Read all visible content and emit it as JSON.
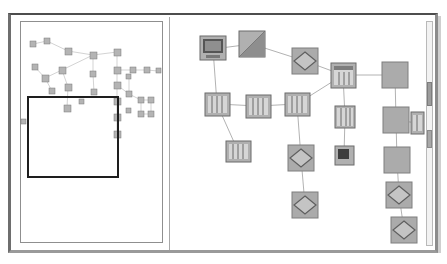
{
  "window": {
    "title": "Network Topology Map",
    "background_color": "#ffffff",
    "frame_color": "#6e6e6e"
  },
  "panels": {
    "overview": {
      "name": "Overview Minimap",
      "border_color": "#8f8f8f",
      "viewport": {
        "label": "viewport-selection",
        "x": 6,
        "y": 74,
        "width": 92,
        "height": 82,
        "color": "#1e1e1e"
      }
    },
    "detail": {
      "name": "Detail Topology View",
      "scrollbar": {
        "orientation": "vertical",
        "track_color": "#f2f2f2",
        "thumb_color": "#9c9c9c"
      }
    }
  },
  "legend": {
    "icon_types": [
      "workstation-icon",
      "router-icon",
      "switch-icon",
      "server-icon",
      "node-icon",
      "device-icon"
    ]
  },
  "chart_data": {
    "type": "network-graph",
    "detail_nodes": [
      {
        "id": "n1",
        "type": "workstation",
        "x": 40,
        "y": 29
      },
      {
        "id": "n2",
        "type": "router",
        "x": 79,
        "y": 24
      },
      {
        "id": "n3",
        "type": "switch",
        "x": 132,
        "y": 41
      },
      {
        "id": "n4",
        "type": "server",
        "x": 44,
        "y": 84
      },
      {
        "id": "n5",
        "type": "server",
        "x": 85,
        "y": 86
      },
      {
        "id": "n6",
        "type": "server",
        "x": 124,
        "y": 84
      },
      {
        "id": "n7",
        "type": "node",
        "x": 170,
        "y": 55
      },
      {
        "id": "n8",
        "type": "node",
        "x": 172,
        "y": 97
      },
      {
        "id": "n9",
        "type": "device",
        "x": 171,
        "y": 135
      },
      {
        "id": "n10",
        "type": "server",
        "x": 65,
        "y": 131
      },
      {
        "id": "n11",
        "type": "switch",
        "x": 128,
        "y": 138
      },
      {
        "id": "n12",
        "type": "switch",
        "x": 132,
        "y": 185
      },
      {
        "id": "n13",
        "type": "plain",
        "x": 222,
        "y": 55
      },
      {
        "id": "n14",
        "type": "plain",
        "x": 223,
        "y": 100
      },
      {
        "id": "n15",
        "type": "plain",
        "x": 224,
        "y": 140
      },
      {
        "id": "n16",
        "type": "switch",
        "x": 226,
        "y": 175
      },
      {
        "id": "n17",
        "type": "switch",
        "x": 231,
        "y": 210
      },
      {
        "id": "n18",
        "type": "node",
        "x": 244,
        "y": 103
      }
    ],
    "detail_links": [
      [
        "n1",
        "n2"
      ],
      [
        "n2",
        "n3"
      ],
      [
        "n1",
        "n4"
      ],
      [
        "n3",
        "n7"
      ],
      [
        "n4",
        "n5"
      ],
      [
        "n5",
        "n6"
      ],
      [
        "n6",
        "n7"
      ],
      [
        "n7",
        "n13"
      ],
      [
        "n7",
        "n8"
      ],
      [
        "n8",
        "n9"
      ],
      [
        "n4",
        "n10"
      ],
      [
        "n6",
        "n11"
      ],
      [
        "n11",
        "n12"
      ],
      [
        "n13",
        "n14"
      ],
      [
        "n14",
        "n18"
      ],
      [
        "n14",
        "n15"
      ],
      [
        "n15",
        "n16"
      ],
      [
        "n16",
        "n17"
      ]
    ],
    "minimap_node_count": 38
  }
}
